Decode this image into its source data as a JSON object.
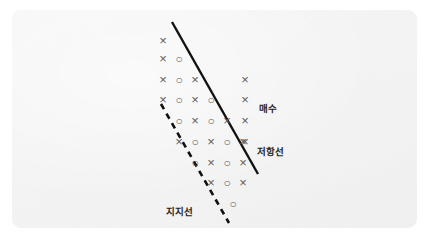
{
  "figure": {
    "kind": "point-and-figure-chart",
    "title_visible": false,
    "card": {
      "background_color": "#f2f2f2",
      "outer_background_color": "#ffffff",
      "corner_radius_px": 9,
      "x": 12,
      "y": 10,
      "width": 405,
      "height": 218
    }
  },
  "chart_data": {
    "type": "scatter",
    "title": "",
    "xlabel": "",
    "ylabel": "",
    "grid": false,
    "legend_position": "none",
    "notation": {
      "x_symbol": "×",
      "o_symbol": "○",
      "x_meaning": "rising column",
      "o_meaning": "falling column",
      "marker_color": "#5d5d5d"
    },
    "rows": [
      {
        "row": 1,
        "marks": [
          "X"
        ],
        "start_col": 1
      },
      {
        "row": 2,
        "marks": [
          "X",
          "O"
        ],
        "start_col": 1
      },
      {
        "row": 3,
        "marks": [
          "X",
          "O",
          "X"
        ],
        "start_col": 1
      },
      {
        "row": 4,
        "marks": [
          "X",
          "O",
          "X",
          "O"
        ],
        "start_col": 1
      },
      {
        "row": 5,
        "marks": [
          "O",
          "X",
          "O",
          "X"
        ],
        "start_col": 2
      },
      {
        "row": 6,
        "marks": [
          "X",
          "O",
          "X",
          "O",
          "X"
        ],
        "start_col": 2
      },
      {
        "row": 7,
        "marks": [
          "O",
          "X",
          "O",
          "X"
        ],
        "start_col": 3
      },
      {
        "row": 8,
        "marks": [
          "X",
          "O",
          "X"
        ],
        "start_col": 4
      },
      {
        "row": 9,
        "marks": [
          "O"
        ],
        "start_col": 5
      }
    ],
    "breakout_column": {
      "label": "매수",
      "marks": [
        "X",
        "X",
        "X",
        "X"
      ],
      "rows": [
        3,
        4,
        5,
        6
      ]
    },
    "points": [
      {
        "sym": "X",
        "x": 163,
        "y": 41
      },
      {
        "sym": "X",
        "x": 163,
        "y": 59
      },
      {
        "sym": "O",
        "x": 179,
        "y": 59
      },
      {
        "sym": "X",
        "x": 163,
        "y": 80
      },
      {
        "sym": "O",
        "x": 179,
        "y": 80
      },
      {
        "sym": "X",
        "x": 195,
        "y": 80
      },
      {
        "sym": "X",
        "x": 163,
        "y": 100
      },
      {
        "sym": "O",
        "x": 179,
        "y": 100
      },
      {
        "sym": "X",
        "x": 195,
        "y": 100
      },
      {
        "sym": "O",
        "x": 211,
        "y": 100
      },
      {
        "sym": "O",
        "x": 179,
        "y": 121
      },
      {
        "sym": "X",
        "x": 195,
        "y": 121
      },
      {
        "sym": "O",
        "x": 211,
        "y": 121
      },
      {
        "sym": "X",
        "x": 227,
        "y": 121
      },
      {
        "sym": "X",
        "x": 179,
        "y": 142
      },
      {
        "sym": "O",
        "x": 195,
        "y": 142
      },
      {
        "sym": "X",
        "x": 211,
        "y": 142
      },
      {
        "sym": "O",
        "x": 227,
        "y": 142
      },
      {
        "sym": "X",
        "x": 243,
        "y": 142
      },
      {
        "sym": "O",
        "x": 195,
        "y": 163
      },
      {
        "sym": "X",
        "x": 211,
        "y": 163
      },
      {
        "sym": "O",
        "x": 227,
        "y": 163
      },
      {
        "sym": "X",
        "x": 243,
        "y": 163
      },
      {
        "sym": "X",
        "x": 211,
        "y": 183
      },
      {
        "sym": "O",
        "x": 227,
        "y": 183
      },
      {
        "sym": "X",
        "x": 243,
        "y": 183
      },
      {
        "sym": "O",
        "x": 233,
        "y": 204
      },
      {
        "sym": "X",
        "x": 245,
        "y": 80
      },
      {
        "sym": "X",
        "x": 245,
        "y": 100
      },
      {
        "sym": "X",
        "x": 245,
        "y": 121
      },
      {
        "sym": "X",
        "x": 245,
        "y": 142
      }
    ],
    "trendlines": [
      {
        "name": "resistance",
        "label": "저항선",
        "style": "solid",
        "color": "#111111",
        "width_px": 2.4,
        "x1": 172,
        "y1": 22,
        "x2": 258,
        "y2": 174
      },
      {
        "name": "support",
        "label": "지지선",
        "style": "dashed",
        "color": "#111111",
        "width_px": 2.6,
        "dash_pattern": "6 5",
        "x1": 161,
        "y1": 104,
        "x2": 229,
        "y2": 223
      }
    ],
    "annotations": [
      {
        "id": "buy",
        "text": "매수",
        "x": 259,
        "y": 101
      },
      {
        "id": "resistance",
        "text": "저항선",
        "x": 257,
        "y": 144
      },
      {
        "id": "support",
        "text": "지지선",
        "x": 166,
        "y": 204
      }
    ]
  }
}
